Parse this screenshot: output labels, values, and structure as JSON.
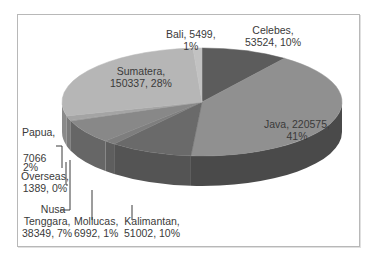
{
  "chart_data": {
    "type": "pie",
    "variant": "3d",
    "title": "",
    "legend": "none",
    "start_angle_deg": 0,
    "direction": "clockwise",
    "slices": [
      {
        "name": "Celebes",
        "value": 53524,
        "percent": "10%",
        "color": "#5c5c5c",
        "side": "#464646"
      },
      {
        "name": "Java",
        "value": 220575,
        "percent": "41%",
        "color": "#909090",
        "side": "#4a4a4a"
      },
      {
        "name": "Kalimantan",
        "value": 51002,
        "percent": "10%",
        "color": "#6a6a6a",
        "side": "#545454"
      },
      {
        "name": "Mollucas",
        "value": 6992,
        "percent": "1%",
        "color": "#7e7e7e",
        "side": "#5e5e5e"
      },
      {
        "name": "Nusa Tenggara",
        "value": 38349,
        "percent": "7%",
        "color": "#888888",
        "side": "#666666"
      },
      {
        "name": "Overseas",
        "value": 1389,
        "percent": "0%",
        "color": "#9a9a9a",
        "side": "#707070"
      },
      {
        "name": "Papua",
        "value": 7066,
        "percent": "2%",
        "color": "#a4a4a4",
        "side": "#7a7a7a"
      },
      {
        "name": "Sumatera",
        "value": 150337,
        "percent": "28%",
        "color": "#b6b6b6",
        "side": "#8a8a8a"
      },
      {
        "name": "Bali",
        "value": 5499,
        "percent": "1%",
        "color": "#c2c2c2",
        "side": "#959595"
      }
    ]
  },
  "labels": {
    "bali": {
      "line1": "Bali, 5499,",
      "line2": "1%"
    },
    "celebes": {
      "line1": "Celebes,",
      "line2": "53524, 10%"
    },
    "sumatera": {
      "line1": "Sumatera,",
      "line2": "150337, 28%"
    },
    "java": {
      "line1": "Java, 220575,",
      "line2": "41%"
    },
    "papua": {
      "line1": "Papua,",
      "line2": "7066",
      "line3": "2%"
    },
    "overseas": {
      "line1": "Overseas,",
      "line2": "1389, 0%"
    },
    "nusa": {
      "line1": "Nusa",
      "line2": "Tenggara,",
      "line3": "38349, 7%"
    },
    "mollucas": {
      "line1": "Mollucas,",
      "line2": "6992, 1%"
    },
    "kalimantan": {
      "line1": "Kalimantan,",
      "line2": "51002, 10%"
    }
  }
}
